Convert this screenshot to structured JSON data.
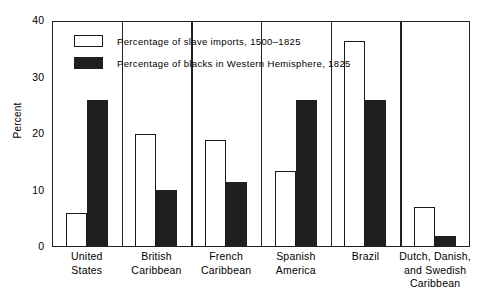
{
  "chart_data": {
    "type": "bar",
    "title": "",
    "xlabel": "",
    "ylabel": "Percent",
    "ylim": [
      0,
      40
    ],
    "yticks": [
      0,
      10,
      20,
      30,
      40
    ],
    "grid": false,
    "legend_position": "upper-left-inside",
    "categories": [
      "United States",
      "British Caribbean",
      "French Caribbean",
      "Spanish America",
      "Brazil",
      "Dutch, Danish, and Swedish Caribbean"
    ],
    "category_lines": [
      [
        "United",
        "States"
      ],
      [
        "British",
        "Caribbean"
      ],
      [
        "French",
        "Caribbean"
      ],
      [
        "Spanish",
        "America"
      ],
      [
        "Brazil"
      ],
      [
        "Dutch, Danish,",
        "and Swedish",
        "Caribbean"
      ]
    ],
    "series": [
      {
        "name": "Percentage of slave imports, 1500–1825",
        "key": "imports",
        "color": "#ffffff",
        "edge_color": "#1a1a1a",
        "values": [
          6,
          20,
          19,
          13.4,
          36.5,
          7
        ]
      },
      {
        "name": "Percentage of blacks in Western Hemisphere, 1825",
        "key": "blacks",
        "color": "#1f1f1f",
        "edge_color": "#1f1f1f",
        "values": [
          26,
          10.1,
          11.5,
          26,
          26,
          2
        ]
      }
    ]
  },
  "axis": {
    "y_label": "Percent",
    "y_tick_labels": [
      "0",
      "10",
      "20",
      "30",
      "40"
    ]
  },
  "legend": {
    "items": [
      {
        "label": "Percentage of slave imports, 1500–1825",
        "key": "imports"
      },
      {
        "label": "Percentage of blacks in Western Hemisphere, 1825",
        "key": "blacks"
      }
    ]
  }
}
